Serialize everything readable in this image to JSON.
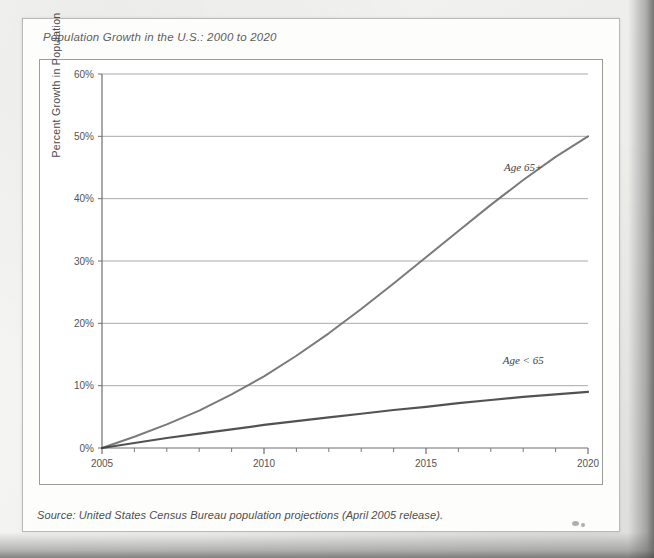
{
  "figure": {
    "title": "Population Growth in the U.S.: 2000 to 2020",
    "source_note": "Source: United States Census Bureau population projections (April 2005 release)."
  },
  "chart_data": {
    "type": "line",
    "title": "Population Growth in the U.S.: 2000 to 2020",
    "xlabel": "",
    "ylabel": "Percent Growth in Population",
    "xlim": [
      2005,
      2020
    ],
    "ylim": [
      0,
      60
    ],
    "y_unit": "%",
    "grid": "horizontal",
    "legend_position": "inline-annotation",
    "x_tick_labels": [
      "2005",
      "2010",
      "2015",
      "2020"
    ],
    "x_tick_values": [
      2005,
      2010,
      2015,
      2020
    ],
    "x_minor_ticks": [
      2006,
      2007,
      2008,
      2009,
      2011,
      2012,
      2013,
      2014,
      2016,
      2017,
      2018,
      2019
    ],
    "y_tick_labels": [
      "0%",
      "10%",
      "20%",
      "30%",
      "40%",
      "50%",
      "60%"
    ],
    "y_tick_values": [
      0,
      10,
      20,
      30,
      40,
      50,
      60
    ],
    "x": [
      2005,
      2006,
      2007,
      2008,
      2009,
      2010,
      2011,
      2012,
      2013,
      2014,
      2015,
      2016,
      2017,
      2018,
      2019,
      2020
    ],
    "series": [
      {
        "name": "Age 65+",
        "label": "Age 65+",
        "color": "#6b6b6b",
        "values": [
          0.0,
          1.8,
          3.8,
          6.0,
          8.6,
          11.5,
          14.8,
          18.4,
          22.3,
          26.4,
          30.6,
          34.8,
          39.0,
          43.0,
          46.7,
          50.0
        ]
      },
      {
        "name": "Age < 65",
        "label": "Age < 65",
        "color": "#3f3f3f",
        "values": [
          0.0,
          0.8,
          1.6,
          2.3,
          3.0,
          3.7,
          4.3,
          4.9,
          5.5,
          6.1,
          6.6,
          7.2,
          7.7,
          8.2,
          8.6,
          9.0
        ]
      }
    ],
    "annotations": [
      {
        "text": "Age 65+",
        "x": 2018.0,
        "y": 44.5
      },
      {
        "text": "Age < 65",
        "x": 2018.0,
        "y": 13.5
      }
    ]
  },
  "colors": {
    "paper": "#fdfdfc",
    "panel_border": "#9d9d99",
    "gridline": "#8f8f8f",
    "series_65plus": "#6b6b6b",
    "series_under65": "#3f3f3f",
    "text": "#4a4a4a"
  }
}
